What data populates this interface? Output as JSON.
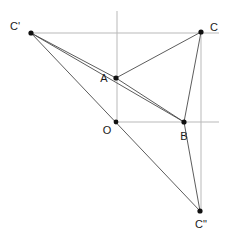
{
  "figure": {
    "type": "geometry-diagram",
    "width": 228,
    "height": 235,
    "background_color": "#ffffff",
    "stroke_color": "#4a4a4a",
    "axis_color": "#b9b9b9",
    "point_color": "#111111"
  },
  "points": {
    "A": {
      "label": "A",
      "x": 116,
      "y": 78,
      "label_x": 104,
      "label_y": 79
    },
    "B": {
      "label": "B",
      "x": 184,
      "y": 122,
      "label_x": 181,
      "label_y": 137
    },
    "O": {
      "label": "O",
      "x": 116,
      "y": 122,
      "label_x": 107,
      "label_y": 130
    },
    "C": {
      "label": "C",
      "x": 201,
      "y": 32,
      "label_x": 210,
      "label_y": 28
    },
    "Cprime": {
      "label": "C'",
      "x": 31,
      "y": 33,
      "label_x": 10,
      "label_y": 27
    },
    "Cdprime": {
      "label": "C\"",
      "x": 200,
      "y": 211,
      "label_x": 195,
      "label_y": 224
    }
  },
  "axes": [
    {
      "name": "vertical-axis-through-A",
      "x1": 117,
      "y1": 11,
      "x2": 117,
      "y2": 122
    },
    {
      "name": "horizontal-axis-through-O-B",
      "x1": 116,
      "y1": 122,
      "x2": 219,
      "y2": 122
    },
    {
      "name": "horizontal-axis-Cprime-C",
      "x1": 31,
      "y1": 33,
      "x2": 219,
      "y2": 33
    },
    {
      "name": "vertical-axis-through-C",
      "x1": 201,
      "y1": 32,
      "x2": 201,
      "y2": 211
    }
  ],
  "segments": [
    {
      "name": "segment-Cprime-A",
      "from": "Cprime",
      "to": "A"
    },
    {
      "name": "segment-A-C",
      "from": "A",
      "to": "C"
    },
    {
      "name": "segment-Cprime-B",
      "from": "Cprime",
      "to": "B"
    },
    {
      "name": "segment-B-C",
      "from": "B",
      "to": "C"
    },
    {
      "name": "segment-Cprime-Cdprime",
      "from": "Cprime",
      "to": "Cdprime"
    },
    {
      "name": "segment-B-Cdprime",
      "from": "B",
      "to": "Cdprime"
    },
    {
      "name": "segment-A-B",
      "from": "A",
      "to": "B"
    }
  ],
  "labels": {
    "A": "A",
    "B": "B",
    "O": "O",
    "C": "C",
    "Cprime": "C'",
    "Cdprime": "C\""
  }
}
